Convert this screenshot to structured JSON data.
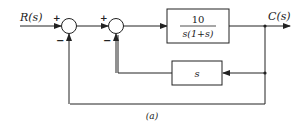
{
  "diagram": {
    "input_label": "R(s)",
    "output_label": "C(s)",
    "caption": "(a)",
    "summer1": {
      "top_sign": "+",
      "bottom_sign": "−"
    },
    "summer2": {
      "top_sign": "+",
      "bottom_sign": "−"
    },
    "forward_block": {
      "numerator": "10",
      "denominator": "s(1+s)"
    },
    "feedback_block": {
      "label": "s"
    },
    "colors": {
      "line": "#222222",
      "background": "#ffffff"
    }
  }
}
